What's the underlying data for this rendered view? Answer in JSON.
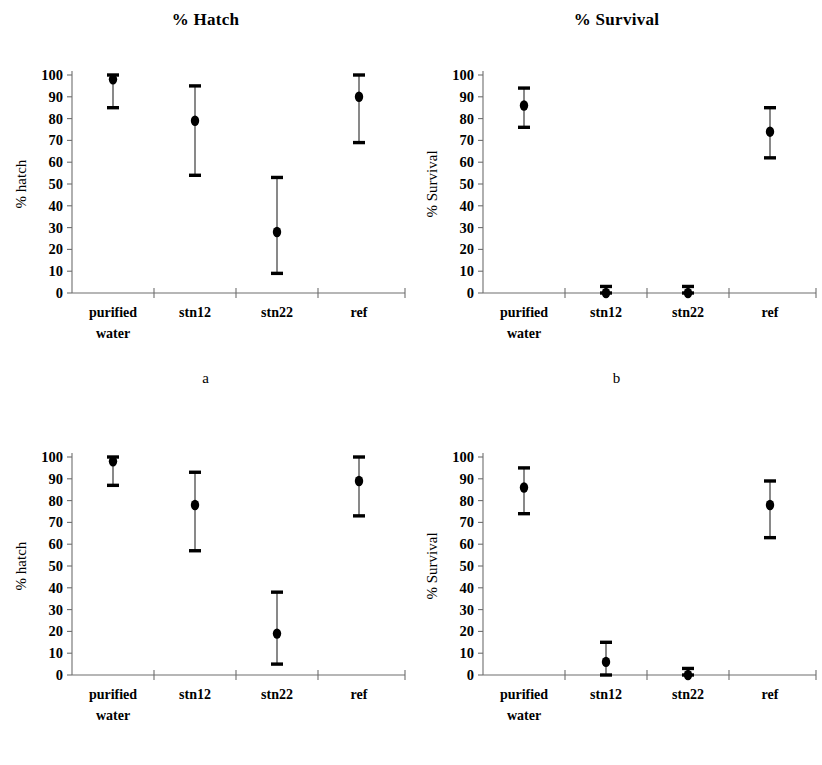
{
  "figure": {
    "column_titles": {
      "left": "% Hatch",
      "right": "% Survival"
    },
    "panel_letters": {
      "a": "a",
      "b": "b",
      "c": "c",
      "d": "d"
    }
  },
  "axis": {
    "y_ticks": [
      "0",
      "10",
      "20",
      "30",
      "40",
      "50",
      "60",
      "70",
      "80",
      "90",
      "100"
    ],
    "y_min": 0,
    "y_max": 100,
    "y_label_hatch": "% hatch",
    "y_label_survival": "% Survival",
    "categories": [
      "purified water",
      "stn12",
      "stn22",
      "ref"
    ],
    "category_lines": [
      [
        "purified",
        "water"
      ],
      [
        "stn12"
      ],
      [
        "stn22"
      ],
      [
        "ref"
      ]
    ]
  },
  "colors": {
    "marker": "#000000",
    "error_bar": "#4a4a4a",
    "axis": "#6e6e6e",
    "background": "#ffffff"
  },
  "chart_data": [
    {
      "type": "scatter",
      "panel": "a",
      "title": "% Hatch",
      "xlabel": "",
      "ylabel": "% hatch",
      "ylim": [
        0,
        100
      ],
      "grid": false,
      "legend": "none",
      "categories": [
        "purified water",
        "stn12",
        "stn22",
        "ref"
      ],
      "values": [
        98,
        79,
        28,
        90
      ],
      "err_low": [
        85,
        54,
        9,
        69
      ],
      "err_high": [
        100,
        95,
        53,
        100
      ]
    },
    {
      "type": "scatter",
      "panel": "b",
      "title": "% Survival",
      "xlabel": "",
      "ylabel": "% Survival",
      "ylim": [
        0,
        100
      ],
      "grid": false,
      "legend": "none",
      "categories": [
        "purified water",
        "stn12",
        "stn22",
        "ref"
      ],
      "values": [
        86,
        0,
        0,
        74
      ],
      "err_low": [
        76,
        0,
        0,
        62
      ],
      "err_high": [
        94,
        3,
        3,
        85
      ]
    },
    {
      "type": "scatter",
      "panel": "c",
      "title": "% Hatch",
      "xlabel": "",
      "ylabel": "% hatch",
      "ylim": [
        0,
        100
      ],
      "grid": false,
      "legend": "none",
      "categories": [
        "purified water",
        "stn12",
        "stn22",
        "ref"
      ],
      "values": [
        98,
        78,
        19,
        89
      ],
      "err_low": [
        87,
        57,
        5,
        73
      ],
      "err_high": [
        100,
        93,
        38,
        100
      ]
    },
    {
      "type": "scatter",
      "panel": "d",
      "title": "% Survival",
      "xlabel": "",
      "ylabel": "% Survival",
      "ylim": [
        0,
        100
      ],
      "grid": false,
      "legend": "none",
      "categories": [
        "purified water",
        "stn12",
        "stn22",
        "ref"
      ],
      "values": [
        86,
        6,
        0,
        78
      ],
      "err_low": [
        74,
        0,
        0,
        63
      ],
      "err_high": [
        95,
        15,
        3,
        89
      ]
    }
  ]
}
